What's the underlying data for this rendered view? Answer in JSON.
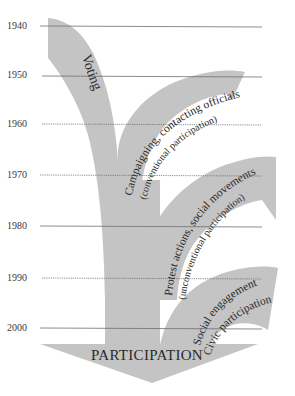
{
  "diagram": {
    "colors": {
      "shape_fill": "#c4c4c4",
      "gridline": "#6e6e6e",
      "text": "#2a2a2a",
      "background": "#ffffff"
    },
    "timeline": {
      "years": [
        "1940",
        "1950",
        "1960",
        "1970",
        "1980",
        "1990",
        "2000"
      ]
    },
    "branches": [
      {
        "id": "voting",
        "label": "Voting"
      },
      {
        "id": "campaigning",
        "label": "Campaigning, contacting officials",
        "sublabel": "(conventional participation)"
      },
      {
        "id": "protest",
        "label": "Protest actions, social movements",
        "sublabel": "(unconventional participation)"
      },
      {
        "id": "civic",
        "label": "Social engagement",
        "sublabel": "Civic participation"
      }
    ],
    "arrow_label": "PARTICIPATION"
  }
}
